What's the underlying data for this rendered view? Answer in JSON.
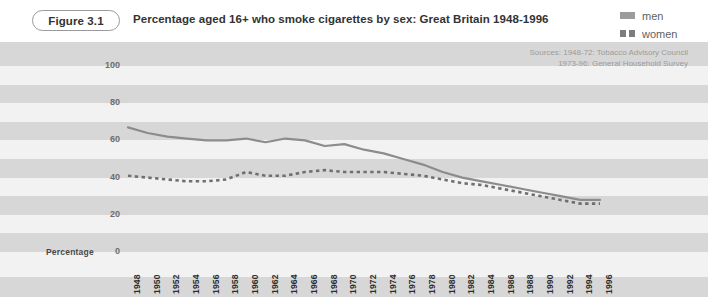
{
  "header": {
    "figure_tag": "Figure 3.1",
    "title": "Percentage aged 16+ who smoke cigarettes by sex: Great Britain 1948-1996"
  },
  "legend": {
    "position": "top-right",
    "items": [
      {
        "label": "men",
        "style": "solid",
        "color": "#9c9c9c"
      },
      {
        "label": "women",
        "style": "dashed",
        "color": "#7d7d7d"
      }
    ]
  },
  "sources": {
    "line1": "Sources: 1948-72: Tobacco Advisory Council",
    "line2": "1973-96: General Household Survey"
  },
  "axes": {
    "ylabel": "Percentage",
    "yticks": [
      "0",
      "20",
      "40",
      "60",
      "80",
      "100"
    ]
  },
  "colors": {
    "background": "#ffffff",
    "band_light": "#f2f2f2",
    "band_dark": "#d7d7d7",
    "men_line": "#8c8c8c",
    "women_line": "#6f6f6f",
    "tick_text": "#2e2e2e",
    "source_text": "#9b9b9b"
  },
  "chart_data": {
    "type": "line",
    "title": "Percentage aged 16+ who smoke cigarettes by sex: Great Britain 1948-1996",
    "xlabel": "",
    "ylabel": "Percentage",
    "ylim": [
      0,
      100
    ],
    "yticks": [
      0,
      20,
      40,
      60,
      80,
      100
    ],
    "grid": false,
    "legend_position": "top-right",
    "categories": [
      1948,
      1950,
      1952,
      1954,
      1956,
      1958,
      1960,
      1962,
      1964,
      1966,
      1968,
      1970,
      1972,
      1974,
      1976,
      1978,
      1980,
      1982,
      1984,
      1986,
      1988,
      1990,
      1992,
      1994,
      1996
    ],
    "series": [
      {
        "name": "men",
        "style": "solid",
        "color": "#8c8c8c",
        "values": [
          67,
          64,
          62,
          61,
          60,
          60,
          61,
          59,
          61,
          60,
          57,
          58,
          55,
          53,
          50,
          47,
          43,
          40,
          38,
          36,
          34,
          32,
          30,
          28,
          28
        ]
      },
      {
        "name": "women",
        "style": "dashed",
        "color": "#6f6f6f",
        "values": [
          41,
          40,
          39,
          38,
          38,
          39,
          43,
          41,
          41,
          43,
          44,
          43,
          43,
          43,
          42,
          41,
          39,
          37,
          36,
          34,
          32,
          30,
          28,
          26,
          26
        ]
      }
    ]
  }
}
